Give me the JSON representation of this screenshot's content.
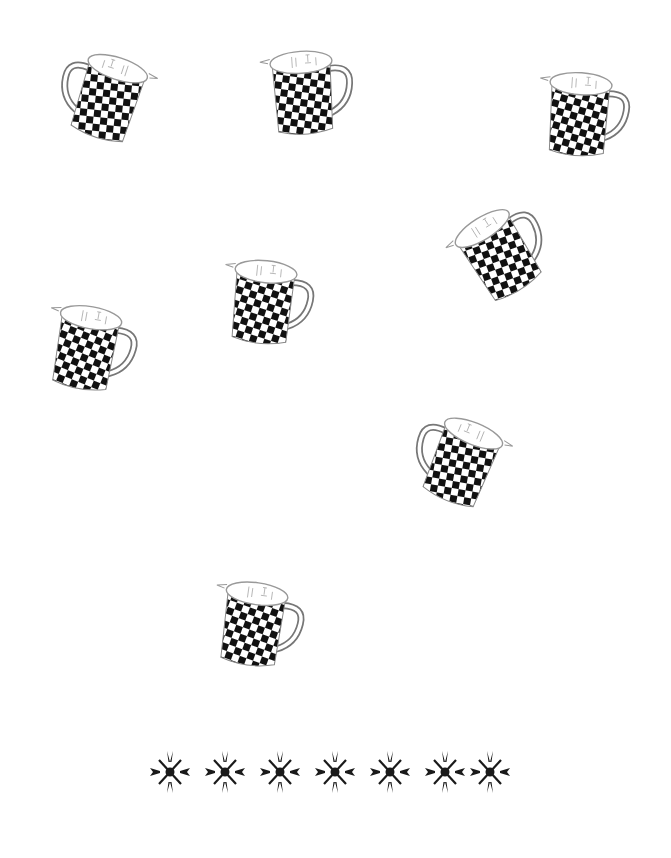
{
  "scene": {
    "background": "#ffffff",
    "object_type": "checkered measuring mug",
    "object_colors": {
      "checker_dark": "#111111",
      "checker_light": "#ffffff",
      "outline": "#777777"
    },
    "mugs": [
      {
        "id": 1,
        "x": 50,
        "y": 40,
        "rotate": 18,
        "flip": true
      },
      {
        "id": 2,
        "x": 252,
        "y": 36,
        "rotate": -4,
        "flip": false
      },
      {
        "id": 3,
        "x": 528,
        "y": 58,
        "rotate": 4,
        "flip": false
      },
      {
        "id": 4,
        "x": 446,
        "y": 196,
        "rotate": -32,
        "flip": false
      },
      {
        "id": 5,
        "x": 212,
        "y": 246,
        "rotate": 6,
        "flip": false
      },
      {
        "id": 6,
        "x": 35,
        "y": 292,
        "rotate": 10,
        "flip": false
      },
      {
        "id": 7,
        "x": 404,
        "y": 404,
        "rotate": 22,
        "flip": true
      },
      {
        "id": 8,
        "x": 202,
        "y": 568,
        "rotate": 8,
        "flip": false
      }
    ],
    "count": 8
  },
  "ornaments": {
    "icon": "snowflake-ornament-icon",
    "count": 7,
    "color": "#1a1a1a",
    "positions_x": [
      0,
      55,
      110,
      165,
      220,
      275,
      320
    ]
  }
}
